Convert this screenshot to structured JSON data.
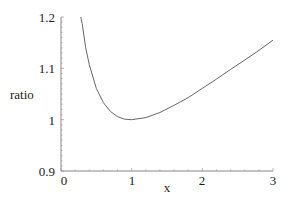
{
  "chart_data": {
    "type": "line",
    "title": "",
    "xlabel": "x",
    "ylabel": "ratio",
    "xlim": [
      0,
      3
    ],
    "ylim": [
      0.9,
      1.2
    ],
    "grid": false,
    "legend": null,
    "x_ticks": [
      "0",
      "1",
      "2",
      "3"
    ],
    "y_ticks": [
      "0.9",
      "1",
      "1.1",
      "1.2"
    ],
    "series": [
      {
        "name": "ratio",
        "color": "#666666",
        "x": [
          0.28,
          0.3,
          0.35,
          0.4,
          0.5,
          0.6,
          0.7,
          0.8,
          0.9,
          1.0,
          1.2,
          1.4,
          1.6,
          1.8,
          2.0,
          2.2,
          2.4,
          2.6,
          2.8,
          3.0
        ],
        "y": [
          1.212,
          1.187,
          1.14,
          1.107,
          1.061,
          1.033,
          1.016,
          1.006,
          1.001,
          1.0,
          1.004,
          1.014,
          1.028,
          1.043,
          1.061,
          1.079,
          1.098,
          1.116,
          1.135,
          1.155
        ]
      }
    ]
  }
}
